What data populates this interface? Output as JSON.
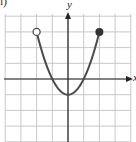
{
  "part_label": "h)",
  "chart_data": {
    "type": "line",
    "title": "",
    "xlabel": "x",
    "ylabel": "y",
    "function": "y = x^2 - 1",
    "domain": "(-2, 2]",
    "xlim": [
      -4,
      4
    ],
    "ylim": [
      -4,
      4
    ],
    "grid": true,
    "grid_step": 1,
    "series": [
      {
        "name": "parabola",
        "x": [
          -2,
          -1.5,
          -1,
          -0.5,
          0,
          0.5,
          1,
          1.5,
          2
        ],
        "y": [
          3,
          1.25,
          0,
          -0.75,
          -1,
          -0.75,
          0,
          1.25,
          3
        ]
      }
    ],
    "endpoints": [
      {
        "x": -2,
        "y": 3,
        "style": "open"
      },
      {
        "x": 2,
        "y": 3,
        "style": "closed"
      }
    ],
    "vertex": {
      "x": 0,
      "y": -1
    },
    "colors": {
      "curve": "#4a4a4a",
      "grid": "#c8c8c8",
      "axis": "#222222"
    }
  }
}
